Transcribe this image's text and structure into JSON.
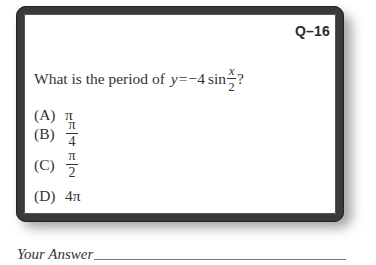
{
  "card": {
    "question_id": "Q–16",
    "question": {
      "prefix": "What is the period of",
      "equation": {
        "lhs": "y",
        "equals": "=",
        "coefficient": "−4",
        "function": "sin",
        "numerator": "x",
        "denominator": "2",
        "suffix": "?"
      }
    },
    "options": [
      {
        "letter": "(A)",
        "value": "π"
      },
      {
        "letter": "(B)",
        "numerator": "π",
        "denominator": "4"
      },
      {
        "letter": "(C)",
        "numerator": "π",
        "denominator": "2"
      },
      {
        "letter": "(D)",
        "value": "4π"
      }
    ]
  },
  "answer": {
    "label": "Your Answer"
  },
  "colors": {
    "border": "#3a3a3a",
    "text": "#333333",
    "background": "#ffffff"
  }
}
